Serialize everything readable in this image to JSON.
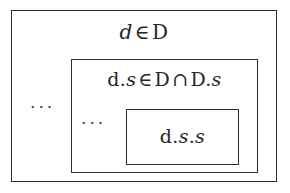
{
  "figure": {
    "type": "nested-set-diagram",
    "background_color": "#ffffff",
    "border_color": "#2b2b2b",
    "text_color": "#262626",
    "boxes": [
      {
        "id": "outer",
        "label": "d ∈ D",
        "label_parts": {
          "lhs": "d",
          "operator": "∈",
          "rhs": "D"
        },
        "ellipsis": "..."
      },
      {
        "id": "middle",
        "label": "d.s ∈ D ∩ D.s",
        "label_parts": {
          "lhs_d": "d.",
          "lhs_s": "s",
          "operator": "∈",
          "rhs_D": "D",
          "operator2": "∩",
          "rhs_D2": "D.",
          "rhs_s2": "s"
        },
        "ellipsis": "..."
      },
      {
        "id": "inner",
        "label": "d.s.s",
        "label_parts": {
          "d": "d.",
          "s1": "s",
          "dot": ".",
          "s2": "s"
        },
        "ellipsis": null
      }
    ]
  }
}
